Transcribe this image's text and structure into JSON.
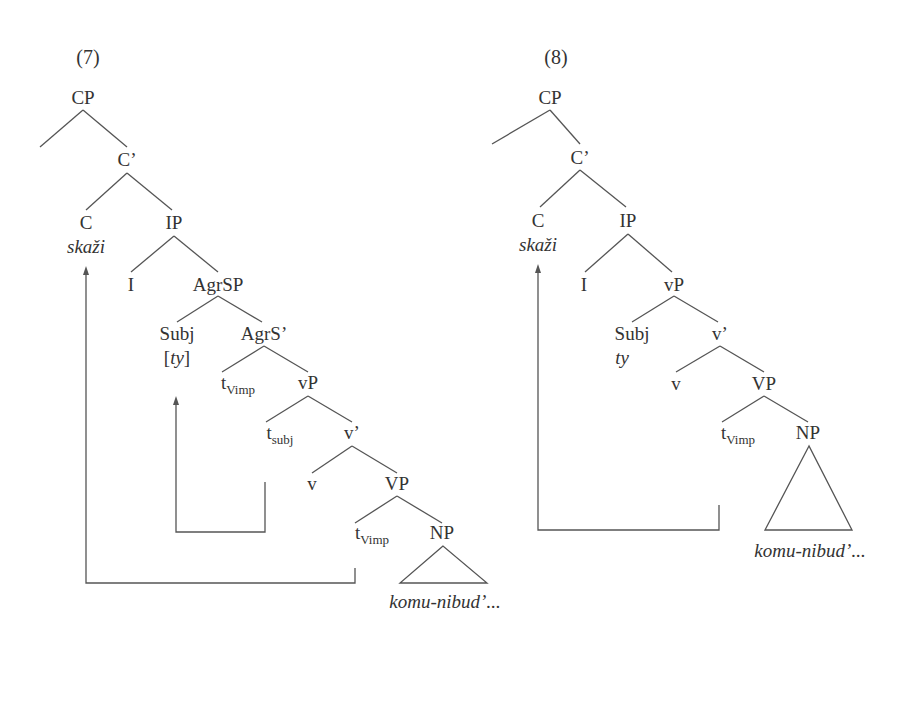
{
  "tree7": {
    "number": "(7)",
    "nodes": {
      "CP": "CP",
      "Cbar": "C’",
      "C": "C",
      "C_word": "skaži",
      "IP": "IP",
      "I": "I",
      "AgrSP": "AgrSP",
      "Subj": "Subj",
      "Subj_word_open": "[",
      "Subj_word": "ty",
      "Subj_word_close": "]",
      "AgrSbar": "AgrS’",
      "t1": "t",
      "t1_sub": "Vimp",
      "vP": "vP",
      "t2": "t",
      "t2_sub": "subj",
      "vbar": "v’",
      "v": "v",
      "VP": "VP",
      "t3": "t",
      "t3_sub": "Vimp",
      "NP": "NP",
      "NP_word": "komu-nibud’..."
    }
  },
  "tree8": {
    "number": "(8)",
    "nodes": {
      "CP": "CP",
      "Cbar": "C’",
      "C": "C",
      "C_word": "skaži",
      "IP": "IP",
      "I": "I",
      "vP": "vP",
      "Subj": "Subj",
      "Subj_word": "ty",
      "vbar": "v’",
      "v": "v",
      "VP": "VP",
      "t1": "t",
      "t1_sub": "Vimp",
      "NP": "NP",
      "NP_word": "komu-nibud’..."
    }
  }
}
